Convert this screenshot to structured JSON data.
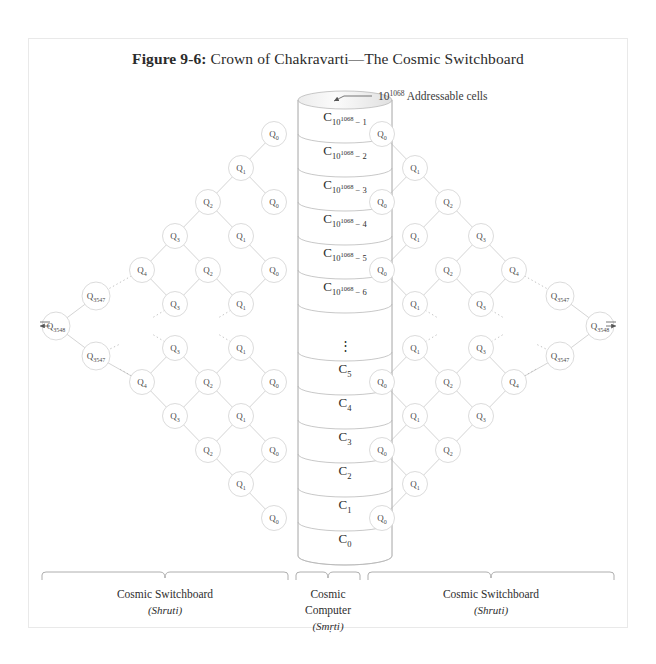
{
  "figure": {
    "number": "Figure 9-6:",
    "title": "Crown of Chakravarti—The Cosmic Switchboard"
  },
  "annotation": {
    "base": "10",
    "exponent": "1068",
    "text": " Addressable cells"
  },
  "cylinder": {
    "name": "Cosmic Computer memory stack",
    "cells_top": [
      {
        "base": "C",
        "sub_base": "10",
        "sub_exp": "1068",
        "sub_tail": " − 1"
      },
      {
        "base": "C",
        "sub_base": "10",
        "sub_exp": "1068",
        "sub_tail": " − 2"
      },
      {
        "base": "C",
        "sub_base": "10",
        "sub_exp": "1068",
        "sub_tail": " − 3"
      },
      {
        "base": "C",
        "sub_base": "10",
        "sub_exp": "1068",
        "sub_tail": " − 4"
      },
      {
        "base": "C",
        "sub_base": "10",
        "sub_exp": "1068",
        "sub_tail": " − 5"
      },
      {
        "base": "C",
        "sub_base": "10",
        "sub_exp": "1068",
        "sub_tail": " − 6"
      }
    ],
    "ellipsis": "⋮",
    "cells_bottom": [
      {
        "base": "C",
        "sub_base": "",
        "sub_exp": "",
        "sub_tail": "5"
      },
      {
        "base": "C",
        "sub_base": "",
        "sub_exp": "",
        "sub_tail": "4"
      },
      {
        "base": "C",
        "sub_base": "",
        "sub_exp": "",
        "sub_tail": "3"
      },
      {
        "base": "C",
        "sub_base": "",
        "sub_exp": "",
        "sub_tail": "2"
      },
      {
        "base": "C",
        "sub_base": "",
        "sub_exp": "",
        "sub_tail": "1"
      },
      {
        "base": "C",
        "sub_base": "",
        "sub_exp": "",
        "sub_tail": "0"
      }
    ]
  },
  "switchboard": {
    "node_letter": "Q",
    "left_nodes": [
      {
        "id": "L-c0-t1",
        "x": 274,
        "y": 134,
        "sub": "0"
      },
      {
        "id": "L-c1-t1",
        "x": 241,
        "y": 168,
        "sub": "1"
      },
      {
        "id": "L-c2-t1",
        "x": 208,
        "y": 202,
        "sub": "2"
      },
      {
        "id": "L-c0-t2",
        "x": 274,
        "y": 202,
        "sub": "0"
      },
      {
        "id": "L-c3-t1",
        "x": 175,
        "y": 236,
        "sub": "3"
      },
      {
        "id": "L-c1-t2",
        "x": 241,
        "y": 236,
        "sub": "1"
      },
      {
        "id": "L-c4-t1",
        "x": 142,
        "y": 270,
        "sub": "4"
      },
      {
        "id": "L-c2-t2",
        "x": 208,
        "y": 270,
        "sub": "2"
      },
      {
        "id": "L-c0-t3",
        "x": 274,
        "y": 270,
        "sub": "0"
      },
      {
        "id": "L-c3547-t",
        "x": 96,
        "y": 296,
        "sub": "3547"
      },
      {
        "id": "L-c3-t2",
        "x": 175,
        "y": 304,
        "sub": "3"
      },
      {
        "id": "L-c1-t3",
        "x": 241,
        "y": 304,
        "sub": "1"
      },
      {
        "id": "L-c3548",
        "x": 56,
        "y": 326,
        "sub": "3548"
      },
      {
        "id": "L-c3547-b",
        "x": 96,
        "y": 356,
        "sub": "3547"
      },
      {
        "id": "L-c3-b2",
        "x": 175,
        "y": 348,
        "sub": "3"
      },
      {
        "id": "L-c1-b3",
        "x": 241,
        "y": 348,
        "sub": "1"
      },
      {
        "id": "L-c4-b1",
        "x": 142,
        "y": 382,
        "sub": "4"
      },
      {
        "id": "L-c2-b2",
        "x": 208,
        "y": 382,
        "sub": "2"
      },
      {
        "id": "L-c0-b3",
        "x": 274,
        "y": 382,
        "sub": "0"
      },
      {
        "id": "L-c3-b1",
        "x": 175,
        "y": 416,
        "sub": "3"
      },
      {
        "id": "L-c1-b2",
        "x": 241,
        "y": 416,
        "sub": "1"
      },
      {
        "id": "L-c2-b1",
        "x": 208,
        "y": 450,
        "sub": "2"
      },
      {
        "id": "L-c0-b2",
        "x": 274,
        "y": 450,
        "sub": "0"
      },
      {
        "id": "L-c1-b1",
        "x": 241,
        "y": 484,
        "sub": "1"
      },
      {
        "id": "L-c0-b1",
        "x": 274,
        "y": 518,
        "sub": "0"
      }
    ],
    "left_edges": [
      [
        "L-c0-t1",
        "L-c1-t1"
      ],
      [
        "L-c1-t1",
        "L-c2-t1"
      ],
      [
        "L-c1-t1",
        "L-c0-t2"
      ],
      [
        "L-c2-t1",
        "L-c3-t1"
      ],
      [
        "L-c2-t1",
        "L-c1-t2"
      ],
      [
        "L-c3-t1",
        "L-c4-t1"
      ],
      [
        "L-c3-t1",
        "L-c2-t2"
      ],
      [
        "L-c1-t2",
        "L-c0-t3"
      ],
      [
        "L-c4-t1",
        "L-c3-t2"
      ],
      [
        "L-c2-t2",
        "L-c1-t3"
      ],
      [
        "L-c2-t2",
        "L-c3-t2"
      ],
      [
        "L-c0-t3",
        "L-c1-t3"
      ],
      [
        "L-c3547-t",
        "L-c3548"
      ],
      [
        "L-c3548",
        "L-c3547-b"
      ],
      [
        "L-c3547-b",
        "L-c4-b1"
      ],
      [
        "L-c3-b2",
        "L-c4-b1"
      ],
      [
        "L-c3-b2",
        "L-c2-b2"
      ],
      [
        "L-c1-b3",
        "L-c2-b2"
      ],
      [
        "L-c1-b3",
        "L-c0-b3"
      ],
      [
        "L-c4-b1",
        "L-c3-b1"
      ],
      [
        "L-c2-b2",
        "L-c3-b1"
      ],
      [
        "L-c2-b2",
        "L-c1-b2"
      ],
      [
        "L-c0-b3",
        "L-c1-b2"
      ],
      [
        "L-c3-b1",
        "L-c2-b1"
      ],
      [
        "L-c1-b2",
        "L-c2-b1"
      ],
      [
        "L-c1-b2",
        "L-c0-b2"
      ],
      [
        "L-c2-b1",
        "L-c1-b1"
      ],
      [
        "L-c0-b2",
        "L-c1-b1"
      ],
      [
        "L-c1-b1",
        "L-c0-b1"
      ]
    ],
    "left_dotted": [
      [
        142,
        270,
        96,
        296
      ],
      [
        175,
        304,
        152,
        318
      ],
      [
        241,
        304,
        218,
        318
      ],
      [
        96,
        356,
        120,
        344
      ],
      [
        175,
        348,
        152,
        334
      ],
      [
        241,
        348,
        218,
        334
      ],
      [
        142,
        382,
        118,
        368
      ]
    ],
    "right_nodes": [
      {
        "id": "R-c0-t1",
        "x": 382,
        "y": 134,
        "sub": "0"
      },
      {
        "id": "R-c1-t1",
        "x": 415,
        "y": 168,
        "sub": "1"
      },
      {
        "id": "R-c2-t1",
        "x": 448,
        "y": 202,
        "sub": "2"
      },
      {
        "id": "R-c0-t2",
        "x": 382,
        "y": 202,
        "sub": "0"
      },
      {
        "id": "R-c3-t1",
        "x": 481,
        "y": 236,
        "sub": "3"
      },
      {
        "id": "R-c1-t2",
        "x": 415,
        "y": 236,
        "sub": "1"
      },
      {
        "id": "R-c4-t1",
        "x": 514,
        "y": 270,
        "sub": "4"
      },
      {
        "id": "R-c2-t2",
        "x": 448,
        "y": 270,
        "sub": "2"
      },
      {
        "id": "R-c0-t3",
        "x": 382,
        "y": 270,
        "sub": "0"
      },
      {
        "id": "R-c3547-t",
        "x": 560,
        "y": 296,
        "sub": "3547"
      },
      {
        "id": "R-c3-t2",
        "x": 481,
        "y": 304,
        "sub": "3"
      },
      {
        "id": "R-c1-t3",
        "x": 415,
        "y": 304,
        "sub": "1"
      },
      {
        "id": "R-c3548",
        "x": 600,
        "y": 326,
        "sub": "3548"
      },
      {
        "id": "R-c3547-b",
        "x": 560,
        "y": 356,
        "sub": "3547"
      },
      {
        "id": "R-c3-b2",
        "x": 481,
        "y": 348,
        "sub": "3"
      },
      {
        "id": "R-c1-b3",
        "x": 415,
        "y": 348,
        "sub": "1"
      },
      {
        "id": "R-c4-b1",
        "x": 514,
        "y": 382,
        "sub": "4"
      },
      {
        "id": "R-c2-b2",
        "x": 448,
        "y": 382,
        "sub": "2"
      },
      {
        "id": "R-c0-b3",
        "x": 382,
        "y": 382,
        "sub": "0"
      },
      {
        "id": "R-c3-b1",
        "x": 481,
        "y": 416,
        "sub": "3"
      },
      {
        "id": "R-c1-b2",
        "x": 415,
        "y": 416,
        "sub": "1"
      },
      {
        "id": "R-c2-b1",
        "x": 448,
        "y": 450,
        "sub": "2"
      },
      {
        "id": "R-c0-b2",
        "x": 382,
        "y": 450,
        "sub": "0"
      },
      {
        "id": "R-c1-b1",
        "x": 415,
        "y": 484,
        "sub": "1"
      },
      {
        "id": "R-c0-b1",
        "x": 382,
        "y": 518,
        "sub": "0"
      }
    ],
    "right_edges": [
      [
        "R-c0-t1",
        "R-c1-t1"
      ],
      [
        "R-c1-t1",
        "R-c2-t1"
      ],
      [
        "R-c1-t1",
        "R-c0-t2"
      ],
      [
        "R-c2-t1",
        "R-c3-t1"
      ],
      [
        "R-c2-t1",
        "R-c1-t2"
      ],
      [
        "R-c3-t1",
        "R-c4-t1"
      ],
      [
        "R-c3-t1",
        "R-c2-t2"
      ],
      [
        "R-c1-t2",
        "R-c0-t3"
      ],
      [
        "R-c4-t1",
        "R-c3-t2"
      ],
      [
        "R-c2-t2",
        "R-c1-t3"
      ],
      [
        "R-c2-t2",
        "R-c3-t2"
      ],
      [
        "R-c0-t3",
        "R-c1-t3"
      ],
      [
        "R-c3547-t",
        "R-c3548"
      ],
      [
        "R-c3548",
        "R-c3547-b"
      ],
      [
        "R-c3547-b",
        "R-c4-b1"
      ],
      [
        "R-c3-b2",
        "R-c4-b1"
      ],
      [
        "R-c3-b2",
        "R-c2-b2"
      ],
      [
        "R-c1-b3",
        "R-c2-b2"
      ],
      [
        "R-c1-b3",
        "R-c0-b3"
      ],
      [
        "R-c4-b1",
        "R-c3-b1"
      ],
      [
        "R-c2-b2",
        "R-c3-b1"
      ],
      [
        "R-c2-b2",
        "R-c1-b2"
      ],
      [
        "R-c0-b3",
        "R-c1-b2"
      ],
      [
        "R-c3-b1",
        "R-c2-b1"
      ],
      [
        "R-c1-b2",
        "R-c2-b1"
      ],
      [
        "R-c1-b2",
        "R-c0-b2"
      ],
      [
        "R-c2-b1",
        "R-c1-b1"
      ],
      [
        "R-c0-b2",
        "R-c1-b1"
      ],
      [
        "R-c1-b1",
        "R-c0-b1"
      ]
    ],
    "right_dotted": [
      [
        514,
        270,
        560,
        296
      ],
      [
        481,
        304,
        504,
        318
      ],
      [
        415,
        304,
        438,
        318
      ],
      [
        560,
        356,
        536,
        344
      ],
      [
        481,
        348,
        504,
        334
      ],
      [
        415,
        348,
        438,
        334
      ],
      [
        514,
        382,
        538,
        368
      ]
    ]
  },
  "braces": [
    {
      "id": "left-brace",
      "label": "Cosmic Switchboard",
      "sub_label": "(Shruti)",
      "x1": 42,
      "x2": 288,
      "label_x": 165
    },
    {
      "id": "center-brace",
      "label_line1": "Cosmic",
      "label_line2": "Computer",
      "sub_label": "(Smṛti)",
      "x1": 296,
      "x2": 360,
      "label_x": 328
    },
    {
      "id": "right-brace",
      "label": "Cosmic Switchboard",
      "sub_label": "(Shruti)",
      "x1": 368,
      "x2": 614,
      "label_x": 491
    }
  ],
  "colors": {
    "frame": "#e9e9e9",
    "edge": "#c9c9c9",
    "node_stroke": "#d2d2d2",
    "cylinder_stroke": "#b6b6b6",
    "text": "#2e2e2e"
  }
}
